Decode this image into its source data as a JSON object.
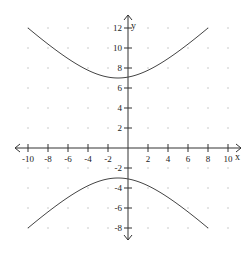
{
  "chart_data": {
    "type": "line",
    "title": "",
    "xlabel": "x",
    "ylabel": "y",
    "xlim": [
      -10,
      10
    ],
    "ylim": [
      -8,
      12
    ],
    "grid": "dots",
    "grid_step": 2,
    "x_ticks": [
      -10,
      -8,
      -6,
      -4,
      -2,
      2,
      4,
      6,
      8,
      10
    ],
    "y_ticks": [
      12,
      10,
      8,
      6,
      4,
      2,
      -2,
      -4,
      -6,
      -8
    ],
    "x_tick_labels": [
      "-10",
      "-8",
      "-6",
      "-4",
      "-2",
      "2",
      "4",
      "6",
      "8",
      "10"
    ],
    "y_tick_labels": [
      "12",
      "10",
      "8",
      "6",
      "4",
      "2",
      "-2",
      "-4",
      "-6",
      "-8"
    ],
    "equation": {
      "h": -1,
      "k": 2,
      "a": 5,
      "b2": 27
    },
    "series": [
      {
        "name": "upper branch",
        "x": [
          -10,
          -8,
          -6,
          -4,
          -2,
          -1,
          0,
          2,
          4,
          6,
          8
        ],
        "y": [
          12,
          10.9,
          9.9,
          9.0,
          7.1,
          7,
          7.1,
          8.0,
          9.0,
          9.9,
          12
        ],
        "x_range": [
          -10,
          8
        ],
        "vertex": [
          -1,
          7
        ]
      },
      {
        "name": "lower branch",
        "x": [
          -10,
          -8,
          -6,
          -4,
          -2,
          -1,
          0,
          2,
          4,
          6,
          8
        ],
        "y": [
          -8,
          -6.9,
          -5.9,
          -5.0,
          -3.1,
          -3,
          -3.1,
          -4.0,
          -5.0,
          -5.9,
          -8
        ],
        "x_range": [
          -10,
          8
        ],
        "vertex": [
          -1,
          -3
        ]
      }
    ]
  },
  "labels": {
    "x_axis": "x",
    "y_axis": "y"
  }
}
